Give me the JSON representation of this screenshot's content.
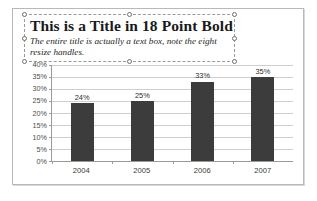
{
  "textbox": {
    "title": "This is a Title in 18 Point Bold",
    "subtitle": "The entire title is actually a text box, note the eight resize handles.",
    "handles": [
      "top-left",
      "top-center",
      "top-right",
      "middle-left",
      "middle-right",
      "bottom-left",
      "bottom-center",
      "bottom-right"
    ],
    "border_style": "dashed",
    "selected": true
  },
  "colors": {
    "bar": "#3c3c3c",
    "gridline": "#cfcfcf",
    "axis": "#9a9a9a",
    "frame": "#b9b9b9",
    "selection": "#9a9a9a",
    "text": "#1a1a1a"
  },
  "chart_data": {
    "type": "bar",
    "title": "",
    "xlabel": "",
    "ylabel": "",
    "categories": [
      "2004",
      "2005",
      "2006",
      "2007"
    ],
    "values": [
      24,
      25,
      33,
      35
    ],
    "data_labels": [
      "24%",
      "25%",
      "33%",
      "35%"
    ],
    "ylim": [
      0,
      40
    ],
    "ytick_values": [
      40,
      35,
      30,
      25,
      20,
      15,
      10,
      5,
      0
    ],
    "ytick_labels": [
      "40%",
      "35%",
      "30%",
      "25%",
      "20%",
      "15%",
      "10%",
      "5%",
      "0%"
    ],
    "grid": true,
    "legend": false,
    "legend_position": "none"
  }
}
